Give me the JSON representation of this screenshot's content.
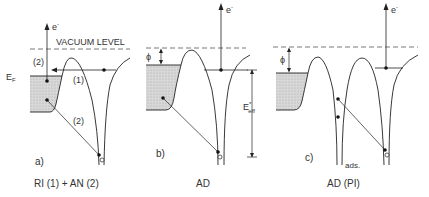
{
  "diagram": {
    "vacuum_level_label": "VACUUM LEVEL",
    "fermi_label": "E",
    "fermi_sub": "F",
    "electron_label": "e",
    "electron_sup": "-",
    "phi_label": "ϕ",
    "eeff_label": "E",
    "eeff_sup": "*",
    "eeff_sub": "eff",
    "ads_label": "ads.",
    "panels": [
      {
        "tag": "a)",
        "caption": "RI (1) + AN (2)",
        "path_labels": [
          "(2)",
          "(1)",
          "(2)"
        ]
      },
      {
        "tag": "b)",
        "caption": "AD"
      },
      {
        "tag": "c)",
        "caption": "AD (PI)"
      }
    ]
  }
}
